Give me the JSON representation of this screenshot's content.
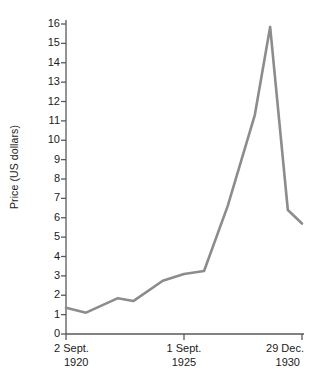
{
  "chart_data": {
    "type": "line",
    "title": "",
    "xlabel": "",
    "ylabel": "Price (US dollars)",
    "ylim": [
      0,
      16
    ],
    "xlim": [
      0,
      10
    ],
    "grid": false,
    "legend": null,
    "line_color": "#8c8c8c",
    "axis_color": "#595959",
    "y_ticks": [
      16,
      15,
      14,
      13,
      12,
      11,
      10,
      9,
      8,
      7,
      6,
      5,
      4,
      3,
      2,
      1,
      0
    ],
    "x_ticks": [
      {
        "date": "2 Sept.",
        "year": "1920",
        "x": 0
      },
      {
        "date": "1 Sept.",
        "year": "1925",
        "x": 5
      },
      {
        "date": "29 Dec.",
        "year": "1930",
        "x": 10
      }
    ],
    "series": [
      {
        "name": "Price",
        "points": [
          {
            "x": 0.0,
            "y": 1.35
          },
          {
            "x": 0.85,
            "y": 1.1
          },
          {
            "x": 2.2,
            "y": 1.85
          },
          {
            "x": 2.85,
            "y": 1.7
          },
          {
            "x": 4.1,
            "y": 2.75
          },
          {
            "x": 5.0,
            "y": 3.1
          },
          {
            "x": 5.85,
            "y": 3.25
          },
          {
            "x": 6.85,
            "y": 6.6
          },
          {
            "x": 8.0,
            "y": 11.3
          },
          {
            "x": 8.65,
            "y": 15.85
          },
          {
            "x": 9.4,
            "y": 6.4
          },
          {
            "x": 10.0,
            "y": 5.7
          }
        ]
      }
    ]
  }
}
